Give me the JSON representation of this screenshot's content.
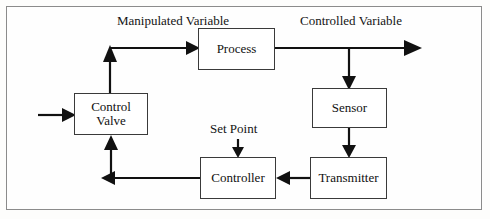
{
  "diagram": {
    "frame": {
      "border_color": "#8b8b8b",
      "background": "#fefefe"
    },
    "line_color": "#111111",
    "blocks": [
      {
        "id": "control-valve",
        "label_line1": "Control",
        "label_line2": "Valve",
        "x": 74,
        "y": 93,
        "w": 74,
        "h": 42
      },
      {
        "id": "process",
        "label_line1": "Process",
        "label_line2": "",
        "x": 198,
        "y": 28,
        "w": 77,
        "h": 42
      },
      {
        "id": "sensor",
        "label_line1": "Sensor",
        "label_line2": "",
        "x": 312,
        "y": 88,
        "w": 75,
        "h": 40
      },
      {
        "id": "transmitter",
        "label_line1": "Transmitter",
        "label_line2": "",
        "x": 310,
        "y": 157,
        "w": 77,
        "h": 42
      },
      {
        "id": "controller",
        "label_line1": "Controller",
        "label_line2": "",
        "x": 200,
        "y": 157,
        "w": 76,
        "h": 42
      }
    ],
    "labels": [
      {
        "id": "manipulated-variable",
        "line1": "Manipulated",
        "line2": "Variable",
        "x": 117,
        "y": 14
      },
      {
        "id": "controlled-variable",
        "line1": "Controlled",
        "line2": "Variable",
        "x": 300,
        "y": 14
      },
      {
        "id": "set-point",
        "line1": "Set Point",
        "line2": "",
        "x": 210,
        "y": 122
      }
    ],
    "signals": [
      {
        "id": "valve-to-process",
        "from": "control-valve",
        "to": "process",
        "label": "Manipulated Variable"
      },
      {
        "id": "process-output",
        "from": "process",
        "to": "output",
        "label": "Controlled Variable"
      },
      {
        "id": "process-to-sensor",
        "from": "process",
        "to": "sensor",
        "label": ""
      },
      {
        "id": "sensor-to-transmitter",
        "from": "sensor",
        "to": "transmitter",
        "label": ""
      },
      {
        "id": "transmitter-to-controller",
        "from": "transmitter",
        "to": "controller",
        "label": ""
      },
      {
        "id": "controller-to-valve",
        "from": "controller",
        "to": "control-valve",
        "label": ""
      },
      {
        "id": "setpoint-to-controller",
        "from": "set-point",
        "to": "controller",
        "label": "Set Point"
      },
      {
        "id": "valve-input",
        "from": "external",
        "to": "control-valve",
        "label": ""
      }
    ]
  }
}
